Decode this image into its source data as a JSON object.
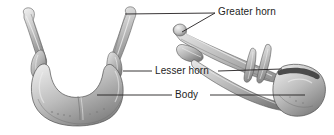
{
  "figure": {
    "name": "hyoid-bone-anatomy-figure",
    "background_color": "#ffffff",
    "width": 334,
    "height": 135,
    "views": [
      {
        "id": "anterior",
        "name": "anterior-view-hyoid",
        "side": "left"
      },
      {
        "id": "lateral",
        "name": "lateral-view-hyoid",
        "side": "right"
      }
    ]
  },
  "labels": {
    "greater_horn": "Greater horn",
    "lesser_horn": "Lesser horn",
    "body": "Body"
  },
  "colors": {
    "text": "#1d1d1d",
    "leader_line": "#231f20",
    "bone_light": "#e8e8e8",
    "bone_mid": "#b9b9b9",
    "bone_dark": "#7d7d7d",
    "bone_shadow": "#5a5a5a",
    "outline": "#4a4a4a"
  },
  "leaders": [
    {
      "name": "leader-greater-horn-anterior",
      "from": [
        125,
        14
      ],
      "to": [
        215,
        13
      ]
    },
    {
      "name": "leader-greater-horn-lateral",
      "from": [
        182,
        32
      ],
      "to": [
        215,
        13
      ]
    },
    {
      "name": "leader-lesser-horn-anterior",
      "from": [
        123,
        71
      ],
      "to": [
        152,
        71
      ]
    },
    {
      "name": "leader-lesser-horn-lateral",
      "from": [
        218,
        71
      ],
      "to": [
        282,
        69
      ]
    },
    {
      "name": "leader-body-anterior",
      "from": [
        97,
        95
      ],
      "to": [
        172,
        95
      ]
    },
    {
      "name": "leader-body-lateral",
      "from": [
        210,
        95
      ],
      "to": [
        305,
        95
      ]
    }
  ]
}
